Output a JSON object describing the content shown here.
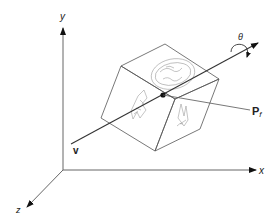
{
  "diagram": {
    "type": "3d-rotation-coordinate-diagram",
    "axes": {
      "x_label": "x",
      "y_label": "y",
      "z_label": "z"
    },
    "rotation_axis_label": "v",
    "rotation_angle_label": "θ",
    "point_label": "P",
    "point_subscript": "f",
    "object": "cube with textured faces",
    "colors": {
      "line": "#555555",
      "axis": "#666666",
      "arrow": "#111111",
      "texture": "#8a8a8a"
    }
  }
}
